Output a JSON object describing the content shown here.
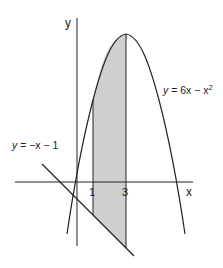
{
  "diagram": {
    "axes": {
      "x_label": "x",
      "y_label": "y",
      "x_ticks": [
        "1",
        "3"
      ]
    },
    "curves": [
      {
        "name": "parabola",
        "label_lhs": "y",
        "label_rhs": " = 6x − x",
        "label_sup": "2"
      },
      {
        "name": "line",
        "label_lhs": "y",
        "label_rhs": " = −x − 1"
      }
    ],
    "shaded_region": {
      "from_x": 1,
      "to_x": 3,
      "color": "#cfcfcf"
    },
    "colors": {
      "stroke": "#222222",
      "shade": "#cfcfcf",
      "background": "#ffffff"
    }
  }
}
